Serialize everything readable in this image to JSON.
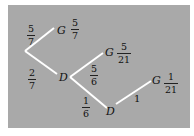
{
  "colors": {
    "background": "#a9a9a9",
    "lines": "#ffffff",
    "text": "#111111"
  },
  "edges": [
    {
      "from": [
        25,
        51
      ],
      "to": [
        54,
        28
      ]
    },
    {
      "from": [
        25,
        51
      ],
      "to": [
        57,
        74
      ]
    },
    {
      "from": [
        70,
        77
      ],
      "to": [
        103,
        53
      ]
    },
    {
      "from": [
        70,
        77
      ],
      "to": [
        107,
        108
      ]
    },
    {
      "from": [
        116,
        104
      ],
      "to": [
        151,
        81
      ]
    }
  ],
  "nodes": {
    "g1": "G",
    "d1": "D",
    "g2": "G",
    "d2": "D",
    "g3": "G"
  },
  "branch_probabilities": {
    "root_to_g1": {
      "num": "5",
      "den": "7"
    },
    "root_to_d1": {
      "num": "2",
      "den": "7"
    },
    "d1_to_g2": {
      "num": "5",
      "den": "6"
    },
    "d1_to_d2": {
      "num": "1",
      "den": "6"
    },
    "d2_to_g3": "1"
  },
  "outcome_probabilities": {
    "g1": {
      "num": "5",
      "den": "7"
    },
    "g2": {
      "num": "5",
      "den": "21"
    },
    "g3": {
      "num": "1",
      "den": "21"
    }
  }
}
